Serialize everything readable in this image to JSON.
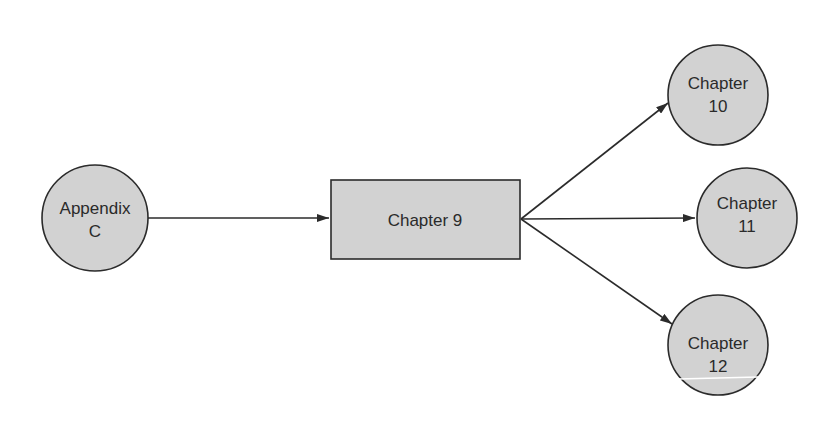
{
  "diagram": {
    "type": "flow",
    "colors": {
      "node_fill": "#d2d2d2",
      "stroke": "#2b2b2b",
      "text": "#2a2a2a",
      "background": "#ffffff"
    },
    "nodes": [
      {
        "id": "appendix_c",
        "shape": "circle",
        "line1": "Appendix",
        "line2": "C"
      },
      {
        "id": "chapter_9",
        "shape": "rectangle",
        "label": "Chapter 9"
      },
      {
        "id": "chapter_10",
        "shape": "circle",
        "line1": "Chapter",
        "line2": "10"
      },
      {
        "id": "chapter_11",
        "shape": "circle",
        "line1": "Chapter",
        "line2": "11"
      },
      {
        "id": "chapter_12",
        "shape": "circle",
        "line1": "Chapter",
        "line2": "12"
      }
    ],
    "edges": [
      {
        "from": "Appendix C",
        "to": "Chapter 9"
      },
      {
        "from": "Chapter 9",
        "to": "Chapter 10"
      },
      {
        "from": "Chapter 9",
        "to": "Chapter 11"
      },
      {
        "from": "Chapter 9",
        "to": "Chapter 12"
      }
    ]
  }
}
